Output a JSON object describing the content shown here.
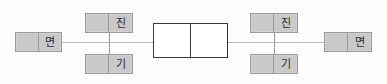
{
  "diagram": {
    "type": "process-flow",
    "background_color": "#fdfdfd",
    "node_fill_color": "#c9c9c9",
    "node_border_color": "#9a9a9a",
    "center_box_fill_color": "#ffffff",
    "center_box_border_color": "#3a3a3a",
    "connector_color": "#b9b9b9",
    "nodes": [
      {
        "id": "left-myeon",
        "label_left": "",
        "label_right": "면",
        "position": {
          "x": 15,
          "y": 32,
          "width": 47,
          "height": 20
        }
      },
      {
        "id": "left-top-jin",
        "label_left": "",
        "label_right": "진",
        "position": {
          "x": 85,
          "y": 13,
          "width": 48,
          "height": 20
        }
      },
      {
        "id": "left-bottom-gi",
        "label_left": "",
        "label_right": "기",
        "position": {
          "x": 85,
          "y": 54,
          "width": 48,
          "height": 20
        }
      },
      {
        "id": "right-top-jin",
        "label_left": "",
        "label_right": "진",
        "position": {
          "x": 250,
          "y": 13,
          "width": 48,
          "height": 20
        }
      },
      {
        "id": "right-bottom-gi",
        "label_left": "",
        "label_right": "기",
        "position": {
          "x": 250,
          "y": 54,
          "width": 48,
          "height": 20
        }
      },
      {
        "id": "right-myeon",
        "label_left": "",
        "label_right": "면",
        "position": {
          "x": 324,
          "y": 32,
          "width": 48,
          "height": 20
        }
      }
    ],
    "center_box": {
      "id": "center-double-cell",
      "cell_left_label": "",
      "cell_right_label": "",
      "position": {
        "x": 153,
        "y": 23,
        "width": 75,
        "height": 35
      }
    },
    "connectors": {
      "horizontal_y": 42,
      "segments": [
        {
          "id": "seg-left",
          "x": 62,
          "width": 91
        },
        {
          "id": "seg-right",
          "x": 228,
          "width": 96
        }
      ],
      "verticals": [
        {
          "id": "vert-left",
          "x": 109,
          "y": 33,
          "height": 21
        },
        {
          "id": "vert-right",
          "x": 274,
          "y": 33,
          "height": 21
        }
      ]
    }
  }
}
